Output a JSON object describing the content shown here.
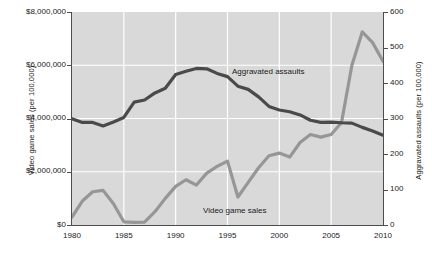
{
  "chart_data": {
    "type": "line",
    "title": "",
    "xlabel": "",
    "x": [
      1980,
      1981,
      1982,
      1983,
      1984,
      1985,
      1986,
      1987,
      1988,
      1989,
      1990,
      1991,
      1992,
      1993,
      1994,
      1995,
      1996,
      1997,
      1998,
      1999,
      2000,
      2001,
      2002,
      2003,
      2004,
      2005,
      2006,
      2007,
      2008,
      2009,
      2010
    ],
    "xlim": [
      1980,
      2010
    ],
    "xticks": [
      1980,
      1985,
      1990,
      1995,
      2000,
      2005,
      2010
    ],
    "xticklabels": [
      "1980",
      "1985",
      "1990",
      "1995",
      "2000",
      "2005",
      "2010"
    ],
    "grid": true,
    "legend_position": "inline-annotations",
    "axes": [
      {
        "id": "left",
        "label": "Video game sales (per 100,000)",
        "lim": [
          0,
          8000000
        ],
        "ticks": [
          0,
          2000000,
          4000000,
          6000000,
          8000000
        ],
        "ticklabels": [
          "$0",
          "$2,000,000",
          "$4,000,000",
          "$6,000,000",
          "$8,000,000"
        ]
      },
      {
        "id": "right",
        "label": "Aggravated assaults (per 100,000)",
        "lim": [
          0,
          600
        ],
        "ticks": [
          0,
          100,
          200,
          300,
          400,
          500,
          600
        ],
        "ticklabels": [
          "0",
          "100",
          "200",
          "300",
          "400",
          "500",
          "600"
        ]
      }
    ],
    "series": [
      {
        "name": "Aggravated assaults",
        "axis": "right",
        "color": "#4a4a4a",
        "annotation": "Aggravated assaults",
        "values": [
          299,
          289,
          289,
          279,
          290,
          303,
          346,
          352,
          372,
          385,
          424,
          433,
          441,
          440,
          427,
          418,
          391,
          382,
          361,
          334,
          324,
          319,
          310,
          295,
          289,
          290,
          288,
          287,
          275,
          265,
          253
        ]
      },
      {
        "name": "Video game sales",
        "axis": "left",
        "color": "#969696",
        "annotation": "Video game sales",
        "values": [
          300000,
          900000,
          1250000,
          1300000,
          800000,
          120000,
          100000,
          110000,
          500000,
          1000000,
          1450000,
          1700000,
          1500000,
          1950000,
          2200000,
          2400000,
          1050000,
          1600000,
          2150000,
          2600000,
          2700000,
          2550000,
          3100000,
          3400000,
          3300000,
          3400000,
          3850000,
          6000000,
          7250000,
          6850000,
          6150000
        ]
      }
    ]
  },
  "labels": {
    "assaults_annotation": "Aggravated assaults",
    "games_annotation": "Video game sales"
  }
}
